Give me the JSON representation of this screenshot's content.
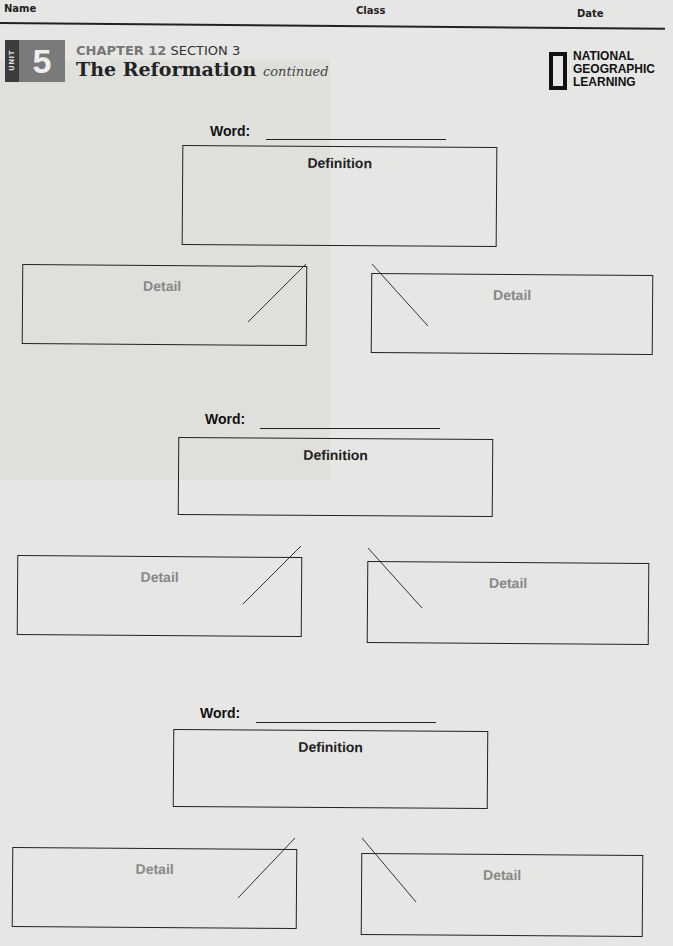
{
  "header": {
    "name_label": "Name",
    "class_label": "Class",
    "date_label": "Date"
  },
  "unit": {
    "label": "UNIT",
    "number": "5"
  },
  "chapter": {
    "chapter_text": "CHAPTER 12",
    "section_text": "SECTION 3",
    "title": "The Reformation",
    "continued": "continued"
  },
  "logo": {
    "line1": "NATIONAL",
    "line2": "GEOGRAPHIC",
    "line3": "LEARNING"
  },
  "organizers": [
    {
      "word_label": "Word:",
      "word_value": "",
      "definition_label": "Definition",
      "detail_left_label": "Detail",
      "detail_right_label": "Detail"
    },
    {
      "word_label": "Word:",
      "word_value": "",
      "definition_label": "Definition",
      "detail_left_label": "Detail",
      "detail_right_label": "Detail"
    },
    {
      "word_label": "Word:",
      "word_value": "",
      "definition_label": "Definition",
      "detail_left_label": "Detail",
      "detail_right_label": "Detail"
    }
  ]
}
